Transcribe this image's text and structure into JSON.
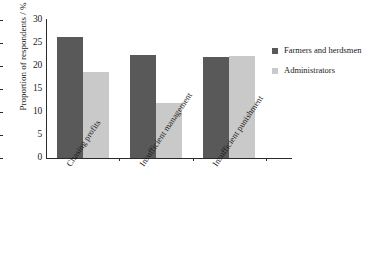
{
  "chart_data": {
    "type": "bar",
    "title": "",
    "xlabel": "",
    "ylabel": "Proportion of respondents / %",
    "ylim": [
      0,
      30
    ],
    "yticks": [
      0,
      5,
      10,
      15,
      20,
      25,
      30
    ],
    "ytick_labels": [
      "0",
      "5",
      "10",
      "15",
      "20",
      "25",
      "30"
    ],
    "grid": false,
    "legend_position": "right",
    "categories": [
      "Chasing profits",
      "Insufficient management",
      "Insufficient punishment"
    ],
    "series": [
      {
        "name": "Farmers and herdsmen",
        "color": "#595959",
        "values": [
          26.2,
          22.5,
          21.9
        ]
      },
      {
        "name": "Administrators",
        "color": "#c9c9c9",
        "values": [
          18.8,
          11.9,
          22.2
        ]
      }
    ]
  },
  "legend": {
    "items": [
      {
        "label": "Farmers and herdsmen"
      },
      {
        "label": "Administrators"
      }
    ]
  },
  "colors": {
    "series_0": "#595959",
    "series_1": "#c9c9c9",
    "axis": "#2b2b2b",
    "background": "#ffffff"
  }
}
